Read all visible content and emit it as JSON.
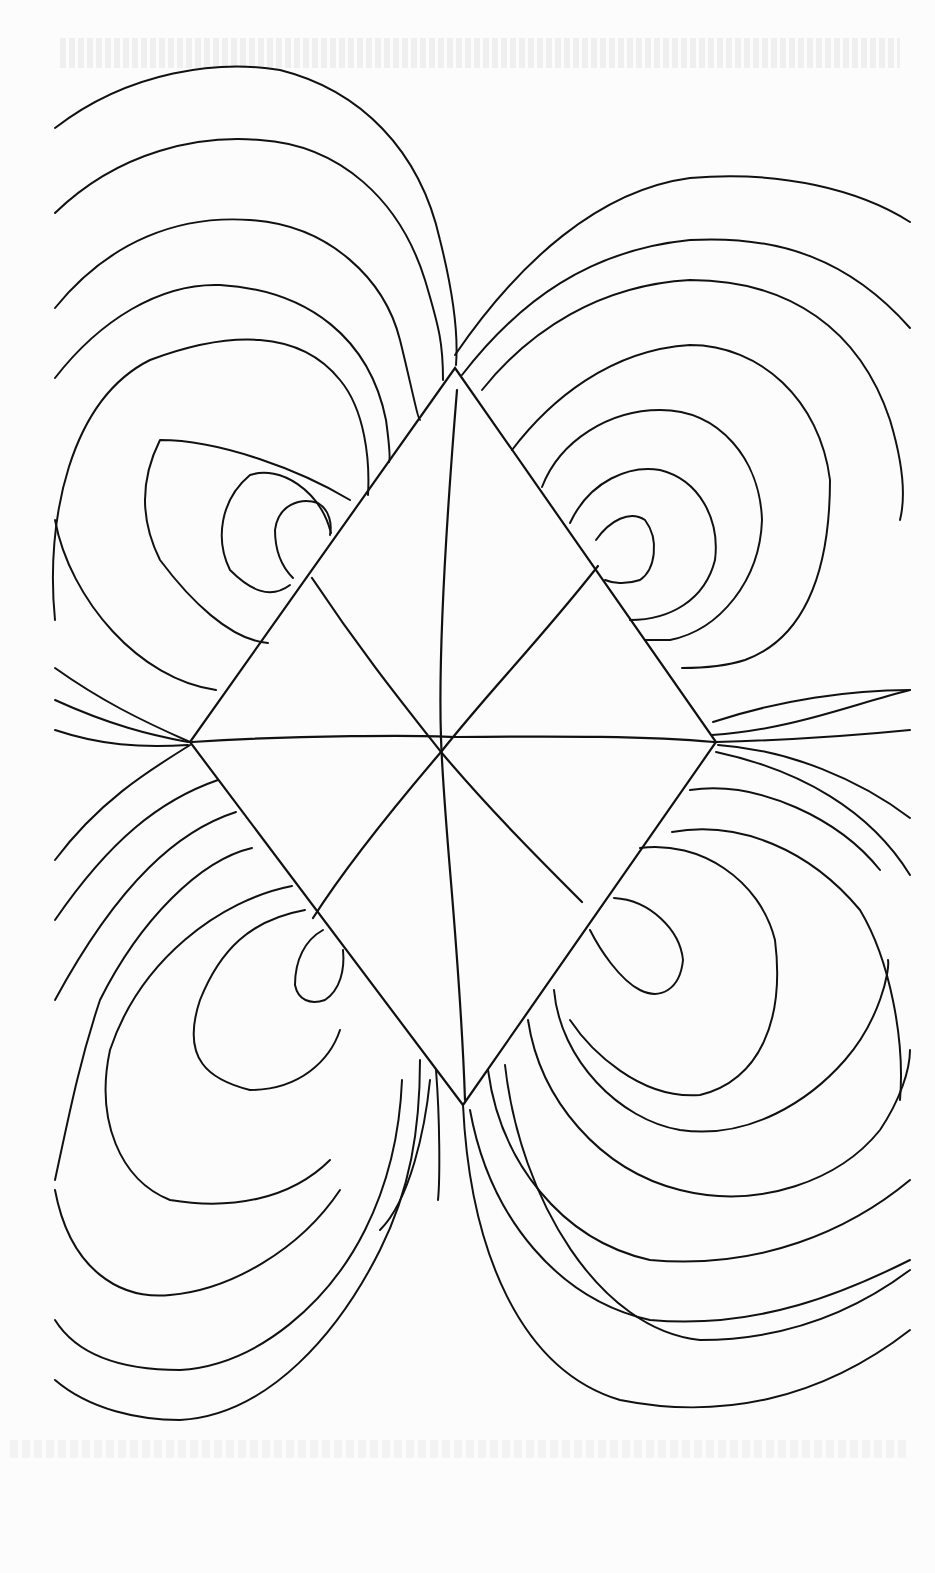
{
  "figure": {
    "colors": {
      "ink": "#111111",
      "paper": "#fcfcfc"
    },
    "stroke_width": 2.2
  },
  "rhombus": {
    "vertices": {
      "top": [
        455,
        368
      ],
      "right": [
        716,
        742
      ],
      "bottom": [
        463,
        1105
      ],
      "left": [
        190,
        742
      ]
    }
  },
  "internal_lines": [
    {
      "name": "horizontal-midline",
      "d": "M192 742 C300 735 420 735 455 737 C560 736 650 736 714 742"
    },
    {
      "name": "vertical-axis",
      "d": "M457 390 C448 500 438 650 441 738 C444 830 460 950 465 1100"
    },
    {
      "name": "diagonal-nw-se",
      "d": "M312 578 C360 650 400 700 441 752 C490 810 540 860 582 902"
    },
    {
      "name": "diagonal-ne-sw",
      "d": "M598 566 C540 640 490 690 441 752 C400 800 350 860 313 918"
    }
  ],
  "field_lines": {
    "upper_left": [
      "M55 128 C130 70 220 60 280 70 C360 90 420 150 440 240 C455 300 458 340 456 365",
      "M55 213 C120 150 200 135 260 140 C340 145 400 200 425 280 C440 330 443 345 443 380",
      "M55 308 C110 240 180 215 250 220 C330 225 385 280 400 340 C410 380 418 420 420 420",
      "M55 378 C100 320 160 283 220 285 C310 290 370 340 386 420 C390 450 390 460 389 462",
      "M55 620 C45 520 70 400 150 360 C230 330 300 330 340 380 C365 410 370 460 368 495",
      "M216 690 C140 680 70 600 55 520",
      "M350 500 C300 470 220 440 160 440 C140 480 140 520 160 560 C190 600 230 640 268 643",
      "M331 533 C320 490 280 465 250 475 C220 500 215 540 230 570 C250 590 270 600 290 585",
      "M293 578 C280 565 275 550 275 530 C278 505 300 497 318 503 C330 510 332 525 330 535",
      "M55 668 C100 700 140 720 190 742",
      "M55 700 C110 725 150 735 188 742",
      "M55 730 C100 745 140 748 188 745"
    ],
    "upper_right": [
      "M455 355 C520 260 600 190 690 178 C780 170 860 190 910 222",
      "M462 375 C520 300 590 250 690 240 C780 235 850 260 910 328",
      "M482 390 C530 330 600 285 690 280 C790 280 860 330 890 420 C905 470 905 500 900 520",
      "M512 450 C550 400 610 350 690 345 C760 345 820 400 830 480 C830 580 800 640 745 660 C720 668 690 668 682 668",
      "M542 487 C560 440 610 410 660 410 C720 410 760 460 762 520 C760 580 720 630 670 640 C655 640 650 640 645 640",
      "M570 523 C590 480 630 465 660 470 C700 480 720 520 715 560 C705 600 670 620 630 620",
      "M596 540 C610 520 630 510 645 520 C660 540 655 570 640 580 C625 585 612 583 605 580",
      "M713 722 C780 700 850 690 910 690",
      "M712 735 C790 730 850 705 910 690",
      "M716 742 C790 740 860 735 910 730"
    ],
    "lower_left": [
      "M190 745 C150 770 100 800 55 860",
      "M218 780 C160 800 110 840 55 920",
      "M236 812 C180 830 120 880 55 1000",
      "M252 848 C200 860 140 920 100 1000 C80 1060 70 1110 55 1180",
      "M292 886 C220 900 140 960 110 1050 C95 1120 120 1180 170 1200 C230 1210 290 1200 330 1160",
      "M305 910 C250 920 220 950 200 1000 C180 1060 210 1080 250 1090 C300 1090 330 1060 340 1030",
      "M323 930 C305 940 295 960 295 985 C298 1000 310 1005 325 1000 C340 990 345 970 343 950",
      "M55 1190 C70 1270 120 1300 170 1295 C230 1290 300 1250 340 1190",
      "M55 1320 C80 1360 130 1370 180 1370 C260 1365 330 1300 365 1230 C390 1180 400 1130 402 1080",
      "M55 1380 C90 1410 140 1420 180 1420 C270 1415 340 1330 380 1250 C410 1190 420 1130 420 1060",
      "M380 1230 C410 1200 425 1130 430 1080",
      "M436 1070 C440 1120 440 1180 438 1200"
    ],
    "lower_right": [
      "M718 745 C790 750 860 780 910 818",
      "M716 752 C800 770 870 810 910 875",
      "M690 790 C760 780 840 820 880 870",
      "M672 832 C740 820 810 850 860 910 C890 960 905 1040 900 1100",
      "M640 848 C700 840 760 880 775 940 C785 1020 760 1080 700 1095 C640 1100 590 1050 570 1020",
      "M614 898 C650 900 680 930 683 960 C680 990 660 1000 640 990 C620 980 600 950 590 930",
      "M554 990 C560 1060 620 1120 680 1130 C750 1140 810 1100 845 1060 C880 1020 890 970 888 960",
      "M528 1020 C540 1100 600 1170 680 1190 C760 1210 840 1180 880 1130 C900 1100 910 1070 910 1050",
      "M488 1070 C500 1160 560 1240 650 1260 C760 1270 850 1230 910 1180",
      "M470 1110 C490 1220 560 1300 650 1320 C760 1330 850 1290 910 1260",
      "M505 1065 C520 1200 600 1330 700 1340 C800 1340 870 1300 910 1270",
      "M463 1105 C470 1250 520 1370 620 1400 C720 1420 820 1400 910 1330"
    ]
  }
}
